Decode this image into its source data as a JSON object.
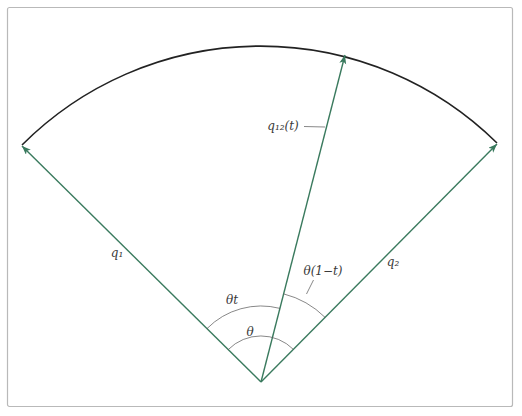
{
  "figure": {
    "labels": {
      "q1": "q₁",
      "q2": "q₂",
      "q12": "q₁₂(t)",
      "theta_t": "θt",
      "theta_one_minus_t": "θ(1−t)",
      "theta": "θ"
    },
    "colors": {
      "vector": "#3a7a5e",
      "arc": "#222222",
      "annotation": "#555555",
      "frame": "#b9b9b9",
      "background": "#ffffff",
      "text": "#3a3a3a"
    }
  }
}
